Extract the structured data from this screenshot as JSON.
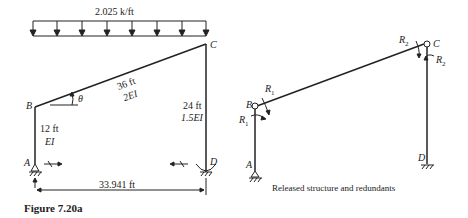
{
  "figure": {
    "caption": "Figure 7.20a",
    "left": {
      "load": "2.025 k/ft",
      "nodes": {
        "A": "A",
        "B": "B",
        "C": "C",
        "D": "D"
      },
      "theta": "θ",
      "member_BC": {
        "length": "36 ft",
        "stiffness": "2EI"
      },
      "member_AB": {
        "length": "12 ft",
        "stiffness": "EI"
      },
      "member_CD": {
        "length": "24 ft",
        "stiffness": "1.5EI"
      },
      "span": "33.941 ft"
    },
    "right": {
      "title": "Released structure and redundants",
      "nodes": {
        "A": "A",
        "B": "B",
        "C": "C",
        "D": "D"
      },
      "redundants": {
        "R1a": "R",
        "R1b": "R",
        "R2a": "R",
        "R2b": "R",
        "sub1": "1",
        "sub2": "2"
      }
    }
  },
  "colors": {
    "line": "#222222",
    "background": "#ffffff"
  }
}
